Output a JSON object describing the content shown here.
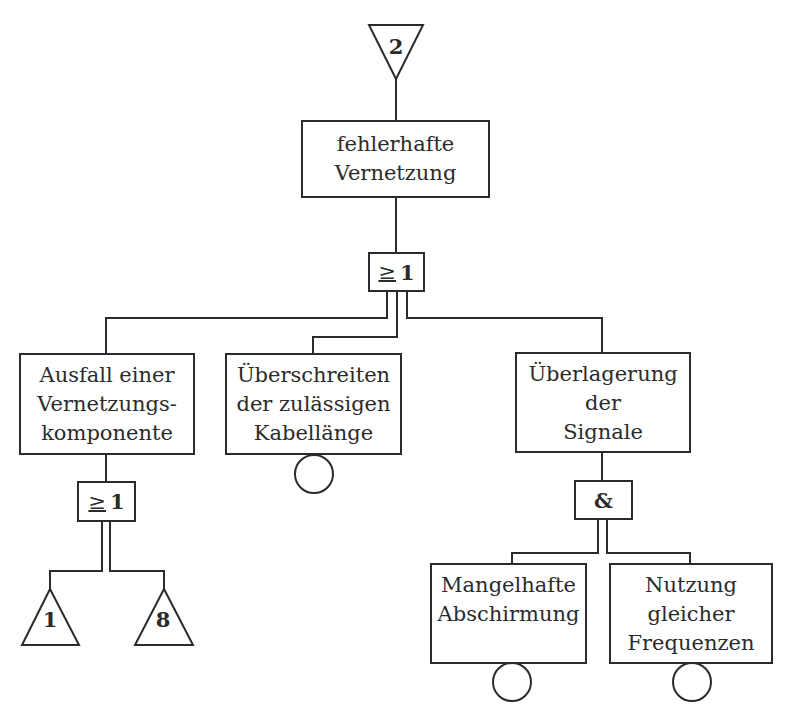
{
  "diagram": {
    "type": "fault-tree",
    "top_transfer": {
      "label": "2",
      "shape": "transfer-in-triangle-down"
    },
    "top_event": {
      "lines": [
        "fehlerhafte",
        "Vernetzung"
      ]
    },
    "top_gate": {
      "symbol": "≥",
      "value": "1",
      "type": "OR"
    },
    "events": [
      {
        "id": "ausfall",
        "lines": [
          "Ausfall einer",
          "Vernetzungs-",
          "komponente"
        ],
        "gate": {
          "symbol": "≥",
          "value": "1",
          "type": "OR"
        },
        "children": [
          {
            "label": "1",
            "shape": "transfer-out-triangle-up"
          },
          {
            "label": "8",
            "shape": "transfer-out-triangle-up"
          }
        ]
      },
      {
        "id": "kabellaenge",
        "lines": [
          "Überschreiten",
          "der zulässigen",
          "Kabellänge"
        ],
        "basic_event": "circle"
      },
      {
        "id": "ueberlagerung",
        "lines": [
          "Überlagerung",
          "der",
          "Signale"
        ],
        "gate": {
          "symbol": "&",
          "type": "AND"
        },
        "children": [
          {
            "lines": [
              "Mangelhafte",
              "Abschirmung"
            ],
            "basic_event": "circle"
          },
          {
            "lines": [
              "Nutzung",
              "gleicher",
              "Frequenzen"
            ],
            "basic_event": "circle"
          }
        ]
      }
    ]
  }
}
